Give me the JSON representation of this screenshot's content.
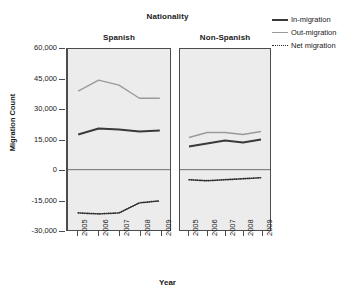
{
  "chart_data": {
    "type": "line",
    "title": "Nationality",
    "xlabel": "Year",
    "ylabel": "Migration Count",
    "x": [
      2005,
      2006,
      2007,
      2008,
      2009
    ],
    "ylim": [
      -30000,
      60000
    ],
    "yticks": [
      60000,
      45000,
      30000,
      15000,
      0,
      -15000,
      -30000
    ],
    "ytick_labels": [
      "60,000",
      "45,000",
      "30,000",
      "15,000",
      "0",
      "-15,000",
      "-30,000"
    ],
    "xtick_labels": [
      "2005",
      "2006",
      "2007",
      "2008",
      "2009"
    ],
    "grid": false,
    "legend_position": "top-right",
    "zero_reference_line": 0,
    "panel_variable": "Nationality",
    "panels": [
      {
        "name": "Spanish",
        "series": [
          {
            "name": "In-migration",
            "values": [
              17500,
              20500,
              20000,
              19000,
              19500
            ]
          },
          {
            "name": "Out-migration",
            "values": [
              39000,
              44500,
              42000,
              35500,
              35500
            ]
          },
          {
            "name": "Net migration",
            "values": [
              -21500,
              -22000,
              -21500,
              -16500,
              -15500
            ]
          }
        ]
      },
      {
        "name": "Non-Spanish",
        "series": [
          {
            "name": "In-migration",
            "values": [
              11500,
              13000,
              14500,
              13500,
              15000
            ]
          },
          {
            "name": "Out-migration",
            "values": [
              16000,
              18500,
              18500,
              17500,
              19000
            ]
          },
          {
            "name": "Net migration",
            "values": [
              -5000,
              -5500,
              -5000,
              -4500,
              -4000
            ]
          }
        ]
      }
    ],
    "legend": [
      {
        "label": "In-migration",
        "style": "solid-thick",
        "color": "#3a3a3a",
        "icon": "line-swatch-icon"
      },
      {
        "label": "Out-migration",
        "style": "solid-thin",
        "color": "#9a9a9a",
        "icon": "line-swatch-icon"
      },
      {
        "label": "Net migration",
        "style": "dotted",
        "color": "#2b2b2b",
        "icon": "dotted-line-swatch-icon"
      }
    ],
    "colors": {
      "in_migration": "#3a3a3a",
      "out_migration": "#9a9a9a",
      "net_migration": "#2b2b2b",
      "panel_background": "#ececed",
      "axis": "#4c4c4c"
    }
  }
}
